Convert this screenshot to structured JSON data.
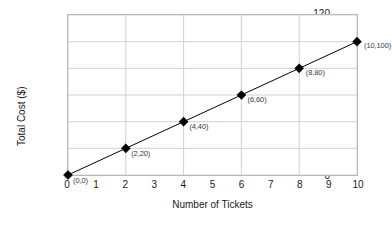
{
  "chart_data": {
    "type": "line",
    "title": "",
    "xlabel": "Number of Tickets",
    "ylabel": "Total Cost ($)",
    "xlim": [
      0,
      10
    ],
    "ylim": [
      0,
      120
    ],
    "xticks": [
      "0",
      "1",
      "2",
      "3",
      "4",
      "5",
      "6",
      "7",
      "8",
      "9",
      "10"
    ],
    "yticks": [
      "0",
      "20",
      "40",
      "60",
      "80",
      "100",
      "120"
    ],
    "grid": "both",
    "legend": "none",
    "marker": "diamond",
    "marker_color": "#000000",
    "line_color": "#000000",
    "grid_color": "#d0d0d0",
    "frame_color": "#b9b9b9",
    "x": [
      0,
      2,
      4,
      6,
      8,
      10
    ],
    "values": [
      0,
      20,
      40,
      60,
      80,
      100
    ],
    "point_labels": [
      "(0,0)",
      "(2,20)",
      "(4,40)",
      "(6,60)",
      "(8,80)",
      "(10,100)"
    ]
  }
}
